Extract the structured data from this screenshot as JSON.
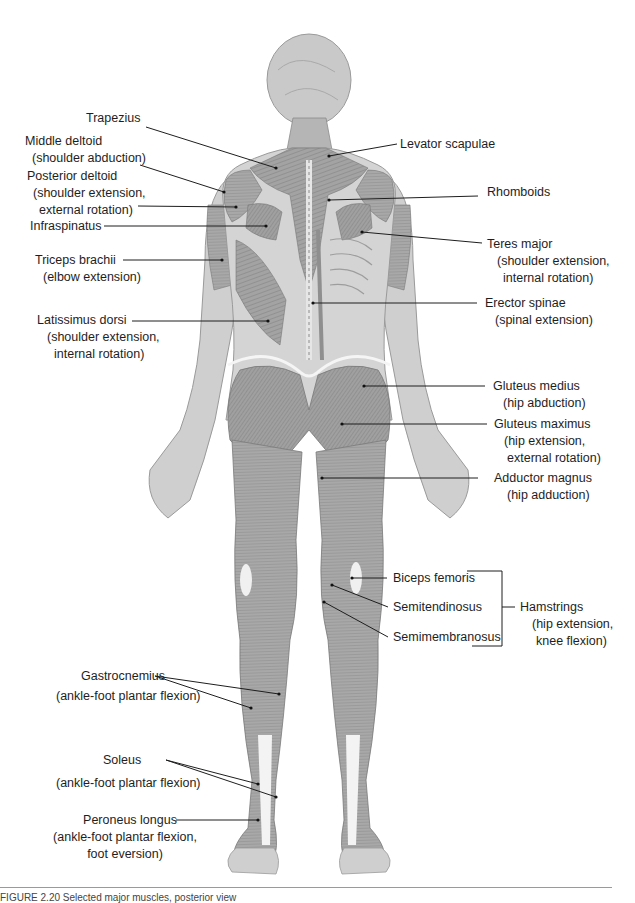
{
  "figure": {
    "caption": "FIGURE 2.20 Selected major muscles, posterior view",
    "labels": {
      "trapezius": {
        "name": "Trapezius",
        "action": ""
      },
      "middle_deltoid": {
        "name": "Middle deltoid",
        "action": "(shoulder abduction)"
      },
      "posterior_deltoid": {
        "name": "Posterior deltoid",
        "action_1": "(shoulder extension,",
        "action_2": "external rotation)"
      },
      "infraspinatus": {
        "name": "Infraspinatus"
      },
      "triceps_brachii": {
        "name": "Triceps brachii",
        "action": "(elbow extension)"
      },
      "latissimus_dorsi": {
        "name": "Latissimus dorsi",
        "action_1": "(shoulder extension,",
        "action_2": "internal rotation)"
      },
      "levator_scapulae": {
        "name": "Levator scapulae"
      },
      "rhomboids": {
        "name": "Rhomboids"
      },
      "teres_major": {
        "name": "Teres major",
        "action_1": "(shoulder extension,",
        "action_2": "internal rotation)"
      },
      "erector_spinae": {
        "name": "Erector spinae",
        "action": "(spinal extension)"
      },
      "gluteus_medius": {
        "name": "Gluteus medius",
        "action": "(hip abduction)"
      },
      "gluteus_maximus": {
        "name": "Gluteus maximus",
        "action_1": "(hip extension,",
        "action_2": "external rotation)"
      },
      "adductor_magnus": {
        "name": "Adductor magnus",
        "action": "(hip adduction)"
      },
      "biceps_femoris": {
        "name": "Biceps femoris"
      },
      "semitendinosus": {
        "name": "Semitendinosus"
      },
      "semimembranosus": {
        "name": "Semimembranosus"
      },
      "hamstrings": {
        "name": "Hamstrings",
        "action_1": "(hip extension,",
        "action_2": "knee flexion)"
      },
      "gastrocnemius": {
        "name": "Gastrocnemius",
        "action": "(ankle-foot plantar flexion)"
      },
      "soleus": {
        "name": "Soleus",
        "action": "(ankle-foot plantar flexion)"
      },
      "peroneus_longus": {
        "name": "Peroneus longus",
        "action_1": "(ankle-foot plantar flexion,",
        "action_2": "foot eversion)"
      }
    },
    "colors": {
      "skin": "#d9d9d9",
      "muscle": "#9a9a9a",
      "muscle_dark": "#7d7d7d",
      "tendon": "#f2f2f2",
      "leader_line": "#1e1e1e"
    }
  }
}
